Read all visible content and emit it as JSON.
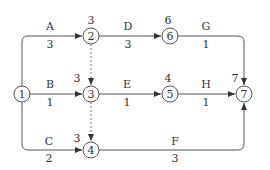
{
  "diagram": {
    "type": "activity-on-arrow network",
    "line_color": "#444444",
    "nodes": [
      {
        "id": "1",
        "label": "1",
        "time": ""
      },
      {
        "id": "2",
        "label": "2",
        "time": "3"
      },
      {
        "id": "3",
        "label": "3",
        "time": "3"
      },
      {
        "id": "4",
        "label": "4",
        "time": "3"
      },
      {
        "id": "5",
        "label": "5",
        "time": "4"
      },
      {
        "id": "6",
        "label": "6",
        "time": "6"
      },
      {
        "id": "7",
        "label": "7",
        "time": "7"
      }
    ],
    "activities": [
      {
        "name": "A",
        "duration": "3",
        "from": "1",
        "to": "2"
      },
      {
        "name": "B",
        "duration": "1",
        "from": "1",
        "to": "3"
      },
      {
        "name": "C",
        "duration": "2",
        "from": "1",
        "to": "4"
      },
      {
        "name": "D",
        "duration": "3",
        "from": "2",
        "to": "6"
      },
      {
        "name": "E",
        "duration": "1",
        "from": "3",
        "to": "5"
      },
      {
        "name": "F",
        "duration": "3",
        "from": "4",
        "to": "7"
      },
      {
        "name": "G",
        "duration": "1",
        "from": "6",
        "to": "7"
      },
      {
        "name": "H",
        "duration": "1",
        "from": "5",
        "to": "7"
      }
    ],
    "dummies": [
      {
        "from": "2",
        "to": "3"
      },
      {
        "from": "3",
        "to": "4"
      }
    ]
  }
}
